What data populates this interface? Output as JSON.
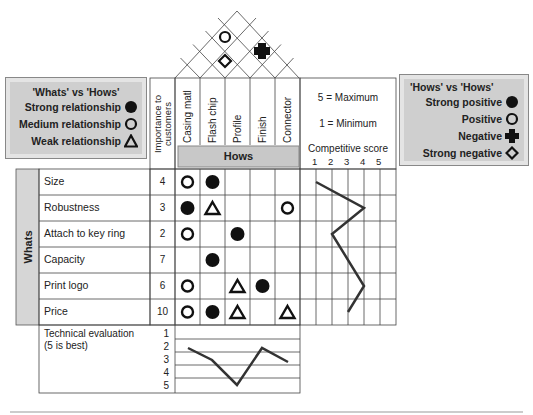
{
  "whats_vs_hows_legend": {
    "title": "'Whats' vs 'Hows'",
    "items": [
      {
        "label": "Strong relationship",
        "symbol": "filled-circle"
      },
      {
        "label": "Medium relationship",
        "symbol": "open-circle"
      },
      {
        "label": "Weak relationship",
        "symbol": "open-triangle"
      }
    ]
  },
  "hows_vs_hows_legend": {
    "title": "'Hows' vs 'Hows'",
    "items": [
      {
        "label": "Strong positive",
        "symbol": "filled-circle"
      },
      {
        "label": "Positive",
        "symbol": "open-circle"
      },
      {
        "label": "Negative",
        "symbol": "filled-cross"
      },
      {
        "label": "Strong negative",
        "symbol": "open-diamond"
      }
    ]
  },
  "importance_header": "Importance to customers",
  "importance_header_lines": [
    "Importance to",
    "customers"
  ],
  "hows_label": "Hows",
  "whats_label": "Whats",
  "hows": [
    "Casing matl",
    "Flash chip",
    "Profile",
    "Finish",
    "Connector"
  ],
  "scale_note": {
    "max": "5 = Maximum",
    "min": "1 = Minimum"
  },
  "competitive_score": {
    "title": "Competitive score",
    "ticks": [
      "1",
      "2",
      "3",
      "4",
      "5"
    ]
  },
  "whats": [
    {
      "label": "Size",
      "importance": "4",
      "relations": [
        "open-circle",
        "filled-circle",
        "",
        "",
        ""
      ],
      "competitive": 1
    },
    {
      "label": "Robustness",
      "importance": "3",
      "relations": [
        "filled-circle",
        "open-triangle",
        "",
        "",
        "open-circle"
      ],
      "competitive": 4
    },
    {
      "label": "Attach to key ring",
      "importance": "2",
      "relations": [
        "open-circle",
        "",
        "filled-circle",
        "",
        ""
      ],
      "competitive": 2
    },
    {
      "label": "Capacity",
      "importance": "7",
      "relations": [
        "",
        "filled-circle",
        "",
        "",
        ""
      ],
      "competitive": 2
    },
    {
      "label": "Print logo",
      "importance": "6",
      "relations": [
        "open-circle",
        "",
        "open-triangle",
        "filled-circle",
        ""
      ],
      "competitive": 4
    },
    {
      "label": "Price",
      "importance": "10",
      "relations": [
        "open-circle",
        "filled-circle",
        "open-triangle",
        "",
        "open-triangle"
      ],
      "competitive": 3
    }
  ],
  "roof_correlations": [
    {
      "pair": [
        "Casing matl",
        "Profile"
      ],
      "symbol": "open-circle"
    },
    {
      "pair": [
        "Casing matl",
        "Finish"
      ],
      "symbol": "open-diamond"
    },
    {
      "pair": [
        "Profile",
        "Connector"
      ],
      "symbol": "filled-cross"
    }
  ],
  "technical_evaluation": {
    "label_line1": "Technical evaluation",
    "label_line2": "(5 is best)",
    "scale": [
      "1",
      "2",
      "3",
      "4",
      "5"
    ],
    "values": [
      2,
      3,
      5,
      2,
      3
    ]
  },
  "chart_data": {
    "type": "line",
    "series": [
      {
        "name": "Competitive score",
        "categories": [
          "Size",
          "Robustness",
          "Attach to key ring",
          "Capacity",
          "Print logo",
          "Price"
        ],
        "values": [
          1,
          4,
          2,
          2,
          4,
          3
        ],
        "range": [
          1,
          5
        ]
      },
      {
        "name": "Technical evaluation (5 is best)",
        "categories": [
          "Casing matl",
          "Flash chip",
          "Profile",
          "Finish",
          "Connector"
        ],
        "values": [
          2,
          3,
          5,
          2,
          3
        ],
        "range": [
          1,
          5
        ]
      }
    ]
  }
}
